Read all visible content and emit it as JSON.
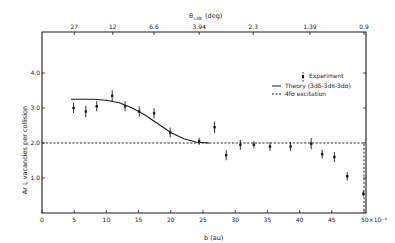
{
  "chart_data": {
    "type": "scatter",
    "title": "",
    "xlabel": "b (au)",
    "x_multiplier_label": "×10⁻⁴",
    "ylabel": "Ar L vacancies per collision",
    "top_xlabel": "θ_LAB (deg)",
    "xlim": [
      0,
      50
    ],
    "ylim": [
      0,
      5.0
    ],
    "grid": false,
    "legend_position": "upper right",
    "x_ticks": [
      0,
      5,
      10,
      15,
      20,
      25,
      30,
      35,
      40,
      45,
      50
    ],
    "x_tick_labels": [
      "0",
      "5",
      "10",
      "15",
      "20",
      "25",
      "30",
      "35",
      "40",
      "45",
      "50×10⁻⁴"
    ],
    "y_ticks": [
      1.0,
      2.0,
      3.0,
      4.0
    ],
    "y_tick_labels": [
      "1.0",
      "2.0",
      "3.0",
      "4.0"
    ],
    "top_ticks": [
      {
        "x": 5.0,
        "label": "27"
      },
      {
        "x": 11.0,
        "label": "12"
      },
      {
        "x": 17.4,
        "label": "6.6"
      },
      {
        "x": 24.4,
        "label": "3.94"
      },
      {
        "x": 32.8,
        "label": "2.3"
      },
      {
        "x": 41.6,
        "label": "1.39"
      },
      {
        "x": 50.0,
        "label": "0.9"
      }
    ],
    "series": [
      {
        "name": "Experiment",
        "style": "points-with-error-bars",
        "x": [
          4.9,
          6.8,
          8.5,
          10.9,
          12.9,
          15.1,
          17.4,
          19.9,
          24.4,
          26.8,
          28.6,
          30.8,
          32.9,
          35.4,
          38.6,
          41.8,
          43.5,
          45.4,
          47.4,
          49.9
        ],
        "y": [
          3.0,
          2.9,
          3.05,
          3.35,
          3.05,
          2.9,
          2.85,
          2.3,
          2.05,
          2.45,
          1.65,
          1.95,
          1.95,
          1.9,
          1.9,
          1.98,
          1.68,
          1.6,
          1.05,
          0.55
        ],
        "yerr": [
          0.1,
          0.12,
          0.1,
          0.12,
          0.1,
          0.1,
          0.1,
          0.1,
          0.06,
          0.12,
          0.1,
          0.1,
          0.06,
          0.08,
          0.08,
          0.12,
          0.08,
          0.1,
          0.08,
          0.04
        ]
      },
      {
        "name": "Theory (3dδ-3dπ-3dσ)",
        "style": "solid-line",
        "x": [
          4.5,
          8,
          10,
          12,
          14,
          16,
          18,
          20,
          22,
          24,
          26
        ],
        "y": [
          3.25,
          3.25,
          3.22,
          3.15,
          3.0,
          2.8,
          2.55,
          2.3,
          2.12,
          2.02,
          2.0
        ]
      },
      {
        "name": "4fσ excitation",
        "style": "dashed-line",
        "x": [
          0,
          50,
          50
        ],
        "y": [
          2.0,
          2.0,
          0
        ]
      }
    ],
    "annotations": []
  },
  "legend": {
    "items": [
      {
        "label": "Experiment",
        "style": "error-bar"
      },
      {
        "label": "Theory (3dδ-3dπ-3dσ)",
        "style": "solid"
      },
      {
        "label": "4fσ excitation",
        "style": "dashed"
      }
    ]
  },
  "labels": {
    "ylabel": "Ar L vacancies per collision",
    "xlabel": "b (au)",
    "top_xlabel": "θ",
    "top_xlabel_sub": "LAB",
    "top_xlabel_unit": "(deg)"
  },
  "colors": {
    "ink": "#1a1a1a",
    "background": "#ffffff"
  }
}
